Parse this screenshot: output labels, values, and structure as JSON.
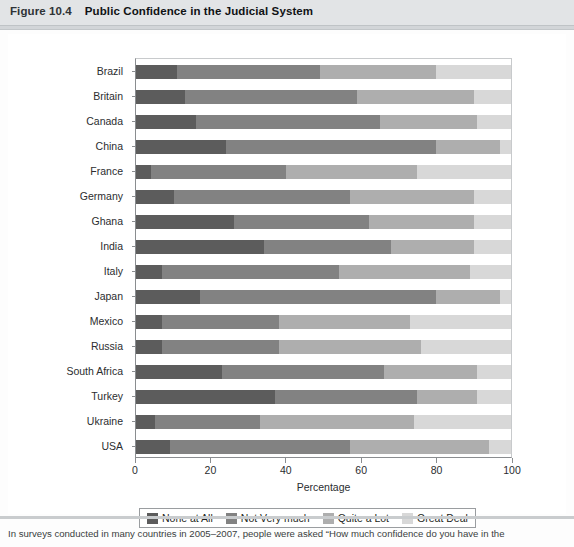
{
  "header": {
    "figure_number": "Figure 10.4",
    "title": "Public Confidence in the Judicial System"
  },
  "footer": {
    "caption": "In surveys conducted in many countries in 2005–2007, people were asked “How much confidence do you have in the"
  },
  "legend": {
    "items": [
      {
        "label": "None at All",
        "color": "#5c5c5c"
      },
      {
        "label": "Not Very much",
        "color": "#828282"
      },
      {
        "label": "Quite a Lot",
        "color": "#aeaeae"
      },
      {
        "label": "Great Deal",
        "color": "#d8d8d8"
      }
    ]
  },
  "axes": {
    "x_title": "Percentage",
    "x_ticks": [
      "0",
      "20",
      "40",
      "60",
      "80",
      "100"
    ]
  },
  "chart_data": {
    "type": "bar",
    "orientation": "horizontal",
    "stacked": true,
    "title": "Public Confidence in the Judicial System",
    "xlabel": "Percentage",
    "ylabel": "",
    "xlim": [
      0,
      100
    ],
    "grid": false,
    "legend_position": "bottom",
    "categories": [
      "Brazil",
      "Britain",
      "Canada",
      "China",
      "France",
      "Germany",
      "Ghana",
      "India",
      "Italy",
      "Japan",
      "Mexico",
      "Russia",
      "South Africa",
      "Turkey",
      "Ukraine",
      "USA"
    ],
    "series": [
      {
        "name": "None at All",
        "color": "#5c5c5c",
        "values": [
          11,
          13,
          16,
          24,
          4,
          10,
          26,
          34,
          7,
          17,
          7,
          7,
          23,
          37,
          5,
          9
        ]
      },
      {
        "name": "Not Very much",
        "color": "#828282",
        "values": [
          38,
          46,
          49,
          56,
          36,
          47,
          36,
          34,
          47,
          63,
          31,
          31,
          43,
          38,
          28,
          48
        ]
      },
      {
        "name": "Quite a Lot",
        "color": "#aeaeae",
        "values": [
          31,
          31,
          26,
          17,
          35,
          33,
          28,
          22,
          35,
          17,
          35,
          38,
          25,
          16,
          41,
          37
        ]
      },
      {
        "name": "Great Deal",
        "color": "#d8d8d8",
        "values": [
          20,
          10,
          9,
          3,
          25,
          10,
          10,
          10,
          11,
          3,
          27,
          24,
          9,
          9,
          26,
          6
        ]
      }
    ],
    "cumulative_endpoints": [
      {
        "category": "Brazil",
        "stops": [
          11,
          49,
          80,
          100
        ]
      },
      {
        "category": "Britain",
        "stops": [
          13,
          59,
          90,
          100
        ]
      },
      {
        "category": "Canada",
        "stops": [
          16,
          65,
          91,
          100
        ]
      },
      {
        "category": "China",
        "stops": [
          24,
          80,
          97,
          100
        ]
      },
      {
        "category": "France",
        "stops": [
          4,
          40,
          75,
          100
        ]
      },
      {
        "category": "Germany",
        "stops": [
          10,
          57,
          90,
          100
        ]
      },
      {
        "category": "Ghana",
        "stops": [
          26,
          62,
          90,
          100
        ]
      },
      {
        "category": "India",
        "stops": [
          34,
          68,
          90,
          100
        ]
      },
      {
        "category": "Italy",
        "stops": [
          7,
          54,
          89,
          100
        ]
      },
      {
        "category": "Japan",
        "stops": [
          17,
          80,
          97,
          100
        ]
      },
      {
        "category": "Mexico",
        "stops": [
          7,
          38,
          73,
          100
        ]
      },
      {
        "category": "Russia",
        "stops": [
          7,
          38,
          76,
          100
        ]
      },
      {
        "category": "South Africa",
        "stops": [
          23,
          66,
          91,
          100
        ]
      },
      {
        "category": "Turkey",
        "stops": [
          37,
          75,
          91,
          100
        ]
      },
      {
        "category": "Ukraine",
        "stops": [
          5,
          33,
          74,
          100
        ]
      },
      {
        "category": "USA",
        "stops": [
          9,
          57,
          94,
          100
        ]
      }
    ]
  }
}
